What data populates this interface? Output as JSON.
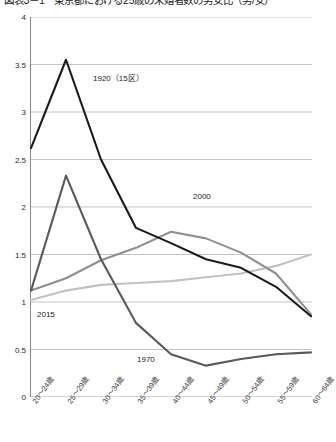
{
  "chart_data": {
    "type": "line",
    "title": "図表3－1　東京都における25歳の未婚者数の男女比（男/女）",
    "xlabel": "",
    "ylabel": "",
    "ylim": [
      0,
      4
    ],
    "ytick_values": [
      0,
      0.5,
      1,
      1.5,
      2,
      2.5,
      3,
      3.5,
      4
    ],
    "ytick_labels": [
      "0",
      "0.5",
      "1",
      "1.5",
      "2",
      "2.5",
      "3",
      "3.5",
      "4"
    ],
    "grid": true,
    "legend_position": "inline-annotations",
    "categories": [
      "20～24歳",
      "25～29歳",
      "30～34歳",
      "35～39歳",
      "40～44歳",
      "45～49歳",
      "50～54歳",
      "55～59歳",
      "60～64歳"
    ],
    "series": [
      {
        "name": "1920 (15区)",
        "label": "1920（15区）",
        "color": "#1a1a1a",
        "values": [
          2.62,
          3.55,
          2.5,
          1.78,
          1.62,
          1.45,
          1.36,
          1.16,
          0.85
        ]
      },
      {
        "name": "1970",
        "label": "1970",
        "color": "#5a5a5a",
        "values": [
          1.12,
          2.33,
          1.45,
          0.78,
          0.45,
          0.33,
          0.4,
          0.45,
          0.47
        ]
      },
      {
        "name": "2000",
        "label": "2000",
        "color": "#8f8f8f",
        "values": [
          1.12,
          1.25,
          1.44,
          1.57,
          1.74,
          1.67,
          1.52,
          1.3,
          0.87
        ]
      },
      {
        "name": "2015",
        "label": "2015",
        "color": "#c2c2c2",
        "values": [
          1.02,
          1.12,
          1.18,
          1.2,
          1.22,
          1.26,
          1.3,
          1.38,
          1.5
        ]
      }
    ],
    "annotations": [
      {
        "text": "1920（15区）",
        "series": "1920 (15区)",
        "x_px": 92,
        "y_px": 74
      },
      {
        "text": "2000",
        "series": "2000",
        "x_px": 192,
        "y_px": 192
      },
      {
        "text": "2015",
        "series": "2015",
        "x_px": 36,
        "y_px": 310
      },
      {
        "text": "1970",
        "series": "1970",
        "x_px": 136,
        "y_px": 355
      }
    ]
  }
}
